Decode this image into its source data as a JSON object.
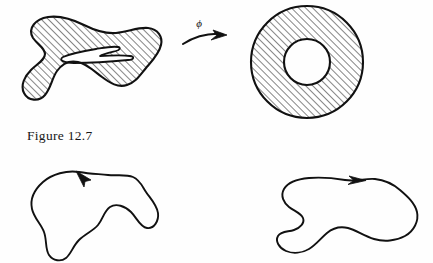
{
  "figure": {
    "caption": "Figure 12.7",
    "background_color": "#fefefe",
    "ink_color": "#111111",
    "hatch_color": "#2b2b2b"
  },
  "map_arrow": {
    "label": "ϕ",
    "label_name": "phi",
    "direction": "left-to-right",
    "style": "curved-arrow-solid-head"
  },
  "top_row": {
    "left_shape": {
      "name": "hatched-blob-with-hole",
      "description": "Irregular hatched blob region with one elongated slit hole",
      "holes": 1,
      "fill": "diagonal-hatch",
      "hatch_angle_degrees": 45
    },
    "right_shape": {
      "name": "hatched-annulus",
      "description": "Circular annulus with diagonal hatching",
      "holes": 1,
      "fill": "diagonal-hatch",
      "hatch_angle_degrees": 45,
      "outer_radius": 56,
      "inner_radius": 23,
      "center_x": 307,
      "center_y": 62
    }
  },
  "bottom_row": {
    "left_curve": {
      "name": "oriented-closed-curve-left",
      "description": "Closed blob curve with orientation arrow",
      "orientation": "counterclockwise",
      "arrow_position": "top",
      "arrow_direction": "up-left",
      "fill": "none"
    },
    "right_curve": {
      "name": "oriented-closed-curve-right",
      "description": "Closed bone-shaped curve with orientation arrow",
      "orientation": "clockwise",
      "arrow_position": "top",
      "arrow_direction": "right",
      "fill": "none"
    }
  }
}
